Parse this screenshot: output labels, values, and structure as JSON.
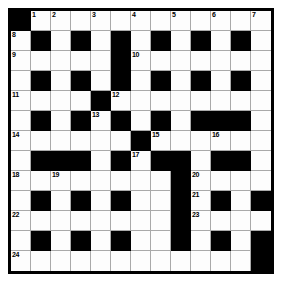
{
  "puzzle": {
    "type": "crossword-grid",
    "rows": 13,
    "cols": 13,
    "cell_size_px": 20,
    "colors": {
      "block": "#000000",
      "open": "#fdfdfd",
      "grid_line": "#a9a9a9",
      "border": "#000000",
      "page_background": "#ffffff"
    },
    "legend": {
      "0": "open (white) square",
      "1": "block (black) square"
    },
    "grid": [
      [
        1,
        0,
        0,
        0,
        0,
        0,
        0,
        0,
        0,
        0,
        0,
        0,
        0
      ],
      [
        0,
        1,
        0,
        1,
        0,
        1,
        0,
        1,
        0,
        1,
        0,
        1,
        0
      ],
      [
        0,
        0,
        0,
        0,
        0,
        1,
        0,
        0,
        0,
        0,
        0,
        0,
        0
      ],
      [
        0,
        1,
        0,
        1,
        0,
        1,
        0,
        1,
        0,
        1,
        0,
        1,
        0
      ],
      [
        0,
        0,
        0,
        0,
        1,
        0,
        0,
        0,
        0,
        0,
        0,
        0,
        0
      ],
      [
        0,
        1,
        0,
        1,
        0,
        1,
        0,
        1,
        0,
        1,
        1,
        1,
        0
      ],
      [
        0,
        0,
        0,
        0,
        0,
        0,
        1,
        0,
        0,
        0,
        0,
        0,
        0
      ],
      [
        0,
        1,
        1,
        1,
        0,
        1,
        0,
        1,
        1,
        0,
        1,
        1,
        0
      ],
      [
        0,
        0,
        0,
        0,
        0,
        0,
        0,
        0,
        1,
        0,
        0,
        0,
        0
      ],
      [
        0,
        1,
        0,
        1,
        0,
        1,
        0,
        0,
        1,
        0,
        1,
        0,
        1
      ],
      [
        0,
        0,
        0,
        0,
        0,
        0,
        0,
        0,
        1,
        0,
        0,
        0,
        0
      ],
      [
        0,
        1,
        0,
        1,
        0,
        1,
        0,
        0,
        1,
        0,
        1,
        0,
        1
      ],
      [
        0,
        0,
        0,
        0,
        0,
        0,
        0,
        0,
        0,
        0,
        0,
        0,
        1
      ]
    ],
    "numbers": [
      {
        "row": 0,
        "col": 1,
        "label": "1"
      },
      {
        "row": 0,
        "col": 2,
        "label": "2"
      },
      {
        "row": 0,
        "col": 4,
        "label": "3"
      },
      {
        "row": 0,
        "col": 6,
        "label": "4"
      },
      {
        "row": 0,
        "col": 8,
        "label": "5"
      },
      {
        "row": 0,
        "col": 10,
        "label": "6"
      },
      {
        "row": 0,
        "col": 12,
        "label": "7"
      },
      {
        "row": 1,
        "col": 0,
        "label": "8"
      },
      {
        "row": 2,
        "col": 0,
        "label": "9"
      },
      {
        "row": 2,
        "col": 6,
        "label": "10"
      },
      {
        "row": 4,
        "col": 0,
        "label": "11"
      },
      {
        "row": 4,
        "col": 5,
        "label": "12"
      },
      {
        "row": 5,
        "col": 4,
        "label": "13"
      },
      {
        "row": 6,
        "col": 0,
        "label": "14"
      },
      {
        "row": 6,
        "col": 7,
        "label": "15"
      },
      {
        "row": 6,
        "col": 10,
        "label": "16"
      },
      {
        "row": 7,
        "col": 6,
        "label": "17"
      },
      {
        "row": 8,
        "col": 0,
        "label": "18"
      },
      {
        "row": 8,
        "col": 2,
        "label": "19"
      },
      {
        "row": 8,
        "col": 9,
        "label": "20"
      },
      {
        "row": 9,
        "col": 9,
        "label": "21"
      },
      {
        "row": 10,
        "col": 0,
        "label": "22"
      },
      {
        "row": 10,
        "col": 9,
        "label": "23"
      },
      {
        "row": 12,
        "col": 0,
        "label": "24"
      }
    ],
    "letters": []
  }
}
